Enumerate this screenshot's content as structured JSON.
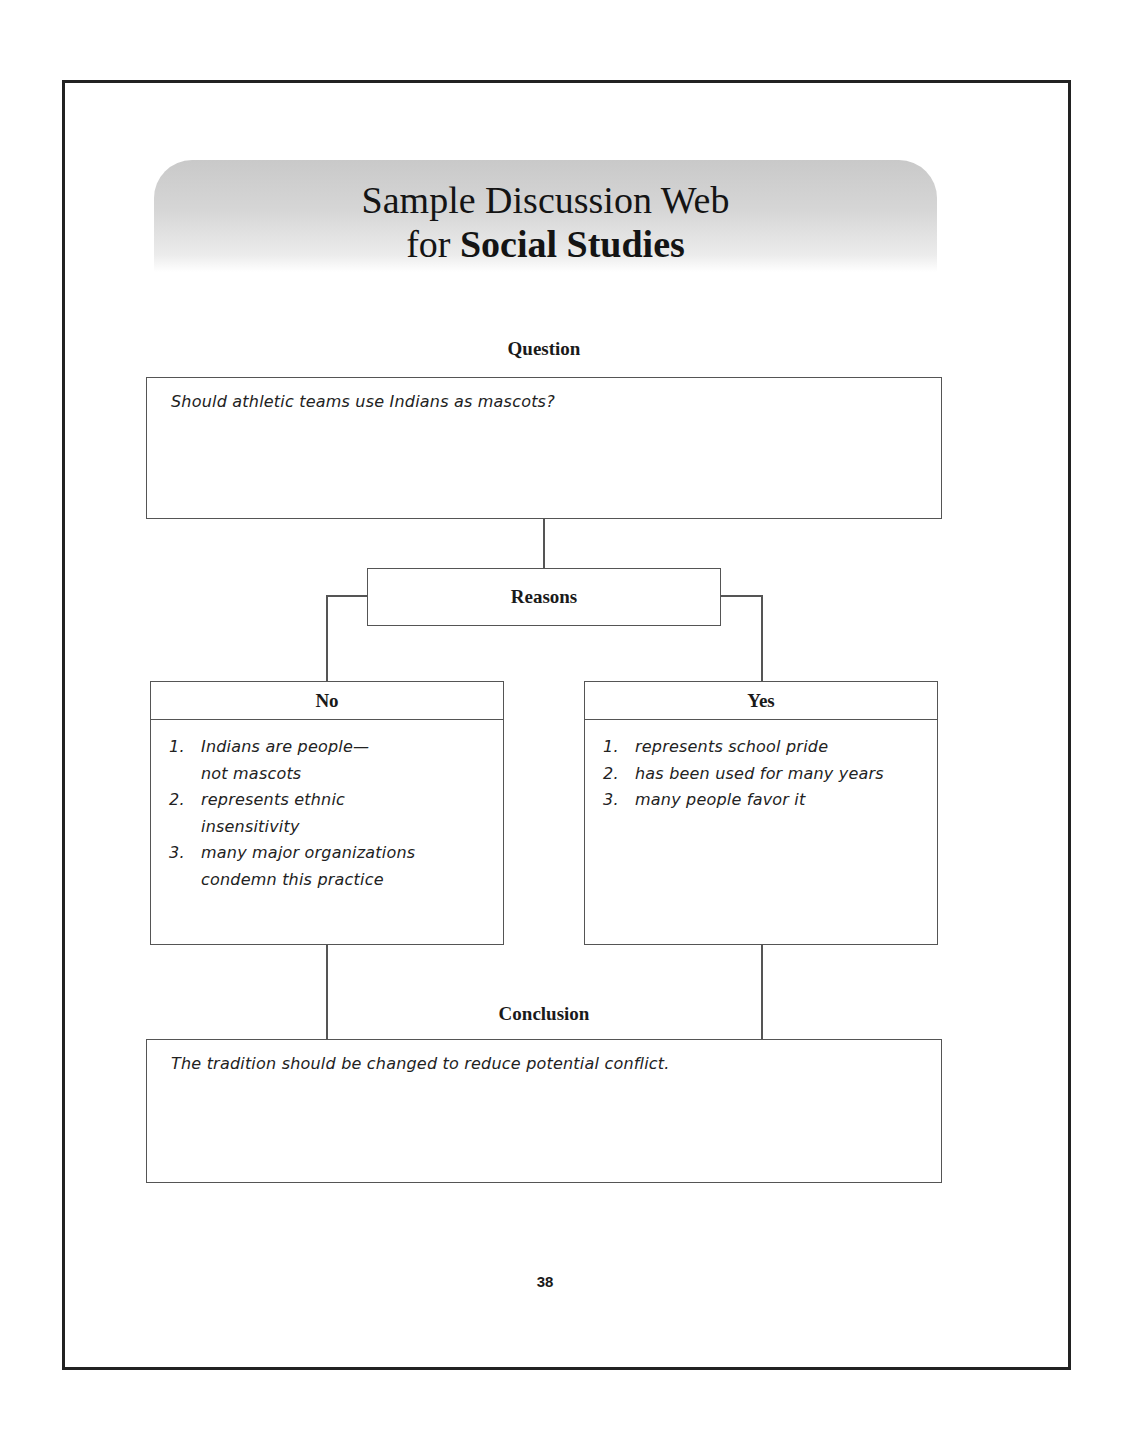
{
  "header": {
    "title_line1": "Sample Discussion Web",
    "title_line2_prefix": "for",
    "title_line2_bold": "Social Studies"
  },
  "question": {
    "label": "Question",
    "text": "Should athletic teams use Indians as mascots?"
  },
  "reasons": {
    "label": "Reasons"
  },
  "no_column": {
    "label": "No",
    "items": [
      {
        "num": "1.",
        "lines": [
          "Indians are people—",
          "not mascots"
        ]
      },
      {
        "num": "2.",
        "lines": [
          "represents ethnic",
          "insensitivity"
        ]
      },
      {
        "num": "3.",
        "lines": [
          "many major organizations",
          "condemn this practice"
        ]
      }
    ]
  },
  "yes_column": {
    "label": "Yes",
    "items": [
      {
        "num": "1.",
        "lines": [
          "represents school pride"
        ]
      },
      {
        "num": "2.",
        "lines": [
          "has been used for many years"
        ]
      },
      {
        "num": "3.",
        "lines": [
          "many people favor it"
        ]
      }
    ]
  },
  "conclusion": {
    "label": "Conclusion",
    "text": "The tradition should be changed to reduce potential conflict."
  },
  "page": {
    "number": "38"
  },
  "colors": {
    "border": "#222222",
    "line": "#555555",
    "banner_gray": "#c9c9c9"
  }
}
